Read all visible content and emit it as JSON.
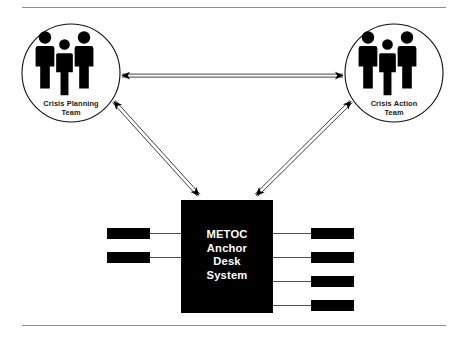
{
  "diagram": {
    "type": "block-diagram",
    "background_color": "#ffffff",
    "rules": {
      "top_label": "top-divider-rule",
      "bottom_label": "bottom-divider-rule",
      "color": "#8e8e8e"
    },
    "nodes": [
      {
        "id": "crisis-planning-team",
        "shape": "circle",
        "label_lines": [
          "Crisis Planning",
          "Team"
        ],
        "icon": "three-people-icon",
        "cx": 71,
        "cy": 73,
        "r": 49,
        "stroke": "#111111",
        "fill": "#ffffff"
      },
      {
        "id": "crisis-action-team",
        "shape": "circle",
        "label_lines": [
          "Crisis Action",
          "Team"
        ],
        "icon": "three-people-icon",
        "cx": 394,
        "cy": 73,
        "r": 49,
        "stroke": "#111111",
        "fill": "#ffffff"
      },
      {
        "id": "metoc-anchor-desk-system",
        "shape": "rect",
        "label_lines": [
          "METOC",
          "Anchor",
          "Desk",
          "System"
        ],
        "x": 181,
        "y": 200,
        "width": 92,
        "height": 113,
        "fill": "#000000",
        "text_color": "#ffffff"
      }
    ],
    "left_blocks": [
      {
        "id": "left-block-1",
        "x": 107,
        "y": 228,
        "width": 43,
        "height": 11,
        "fill": "#000000"
      },
      {
        "id": "left-block-2",
        "x": 107,
        "y": 252,
        "width": 43,
        "height": 11,
        "fill": "#000000"
      }
    ],
    "right_blocks": [
      {
        "id": "right-block-1",
        "x": 311,
        "y": 228,
        "width": 43,
        "height": 11,
        "fill": "#000000"
      },
      {
        "id": "right-block-2",
        "x": 311,
        "y": 252,
        "width": 43,
        "height": 11,
        "fill": "#000000"
      },
      {
        "id": "right-block-3",
        "x": 311,
        "y": 276,
        "width": 43,
        "height": 11,
        "fill": "#000000"
      },
      {
        "id": "right-block-4",
        "x": 311,
        "y": 300,
        "width": 43,
        "height": 11,
        "fill": "#000000"
      }
    ],
    "connectors": [
      {
        "id": "cpt-to-cat",
        "style": "double-line",
        "arrowheads": "both",
        "from": "crisis-planning-team",
        "to": "crisis-action-team"
      },
      {
        "id": "cpt-to-hub",
        "style": "double-line",
        "arrowheads": "both",
        "from": "crisis-planning-team",
        "to": "metoc-anchor-desk-system"
      },
      {
        "id": "cat-to-hub",
        "style": "double-line",
        "arrowheads": "both",
        "from": "crisis-action-team",
        "to": "metoc-anchor-desk-system"
      }
    ],
    "leader_lines": [
      {
        "id": "leader-left-1",
        "x1": 150,
        "y1": 233,
        "x2": 181,
        "y2": 233
      },
      {
        "id": "leader-left-2",
        "x1": 150,
        "y1": 257,
        "x2": 181,
        "y2": 257
      },
      {
        "id": "leader-right-1",
        "x1": 273,
        "y1": 233,
        "x2": 311,
        "y2": 233
      },
      {
        "id": "leader-right-2",
        "x1": 273,
        "y1": 257,
        "x2": 311,
        "y2": 257
      },
      {
        "id": "leader-right-3",
        "x1": 273,
        "y1": 281,
        "x2": 311,
        "y2": 281
      },
      {
        "id": "leader-right-4",
        "x1": 273,
        "y1": 305,
        "x2": 311,
        "y2": 305
      }
    ]
  },
  "labels": {
    "crisis_planning_line1": "Crisis Planning",
    "crisis_planning_line2": "Team",
    "crisis_action_line1": "Crisis Action",
    "crisis_action_line2": "Team",
    "hub_line1": "METOC",
    "hub_line2": "Anchor",
    "hub_line3": "Desk",
    "hub_line4": "System"
  }
}
